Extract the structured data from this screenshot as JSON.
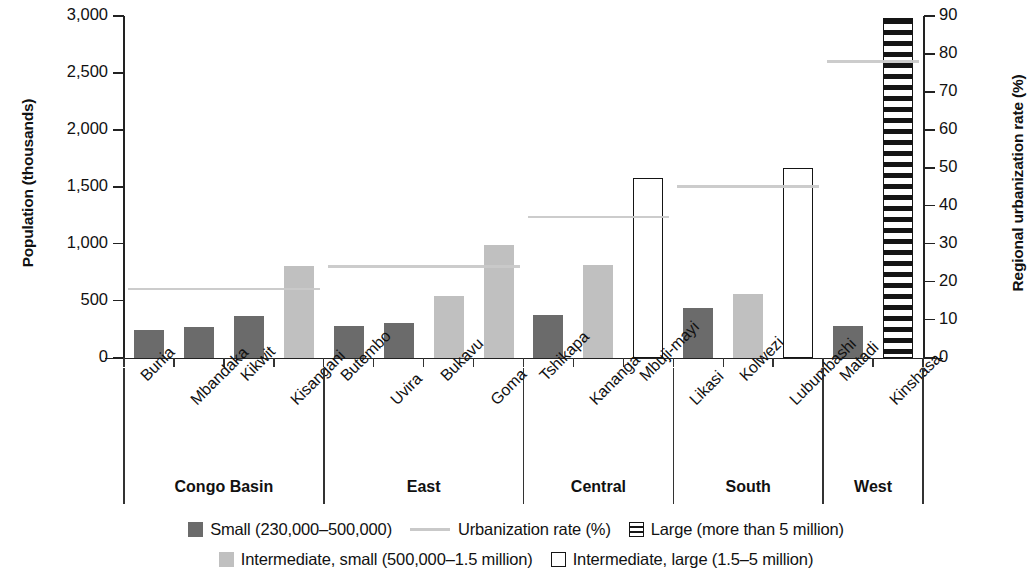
{
  "chart_data": {
    "type": "bar",
    "title": "",
    "ylabel": "Population (thousands)",
    "y2label": "Regional urbanization rate (%)",
    "xlabel": "",
    "ylim": [
      0,
      3000
    ],
    "y2lim": [
      0,
      90
    ],
    "yticks": [
      "0",
      "500",
      "1,000",
      "1,500",
      "2,000",
      "2,500",
      "3,000"
    ],
    "ytick_values": [
      0,
      500,
      1000,
      1500,
      2000,
      2500,
      3000
    ],
    "y2ticks": [
      "0",
      "10",
      "20",
      "30",
      "40",
      "50",
      "60",
      "70",
      "80",
      "90"
    ],
    "y2tick_values": [
      0,
      10,
      20,
      30,
      40,
      50,
      60,
      70,
      80,
      90
    ],
    "grid": false,
    "legend_position": "bottom",
    "categories": [
      "Bunia",
      "Mbandaka",
      "Kikwit",
      "Kisangani",
      "Butembo",
      "Uvira",
      "Bukavu",
      "Goma",
      "Tshikapa",
      "Kananga",
      "Mbuji-mayi",
      "Likasi",
      "Kolwezi",
      "Lubumbashi",
      "Matadi",
      "Kinshasa"
    ],
    "values": [
      250,
      275,
      365,
      810,
      285,
      310,
      545,
      990,
      380,
      820,
      1580,
      440,
      565,
      1670,
      285,
      2985
    ],
    "bar_classes": [
      "small",
      "small",
      "small",
      "intermediate-small",
      "small",
      "small",
      "intermediate-small",
      "intermediate-small",
      "small",
      "intermediate-small",
      "intermediate-large",
      "small",
      "intermediate-small",
      "intermediate-large",
      "small",
      "large"
    ],
    "groups": [
      {
        "label": "Congo Basin",
        "start": 0,
        "end": 3,
        "urbanization_rate": 18
      },
      {
        "label": "East",
        "start": 4,
        "end": 7,
        "urbanization_rate": 24
      },
      {
        "label": "Central",
        "start": 8,
        "end": 10,
        "urbanization_rate": 37
      },
      {
        "label": "South",
        "start": 11,
        "end": 13,
        "urbanization_rate": 45
      },
      {
        "label": "West",
        "start": 14,
        "end": 15,
        "urbanization_rate": 78
      }
    ],
    "series": [
      {
        "name": "Small (230,000–500,000)",
        "key": "small"
      },
      {
        "name": "Intermediate, small (500,000–1.5 million)",
        "key": "intermediate-small"
      },
      {
        "name": "Intermediate, large (1.5–5 million)",
        "key": "intermediate-large"
      },
      {
        "name": "Large (more than 5 million)",
        "key": "large"
      },
      {
        "name": "Urbanization rate (%)",
        "key": "rate"
      }
    ]
  },
  "legend": {
    "row1": [
      {
        "swatch": "small",
        "label": "Small (230,000–500,000)"
      },
      {
        "swatch": "rate",
        "label": "Urbanization rate (%)"
      },
      {
        "swatch": "large",
        "label": "Large (more than 5 million)"
      }
    ],
    "row2": [
      {
        "swatch": "intermediate-small",
        "label": "Intermediate, small (500,000–1.5 million)"
      },
      {
        "swatch": "intermediate-large",
        "label": "Intermediate, large (1.5–5 million)"
      }
    ]
  },
  "colors": {
    "small": "#6b6b6b",
    "intermediate_small": "#c0c0c0",
    "outline": "#151515",
    "rate_line": "#c9c9c9",
    "axis": "#222222",
    "text": "#111111",
    "background": "#ffffff"
  }
}
